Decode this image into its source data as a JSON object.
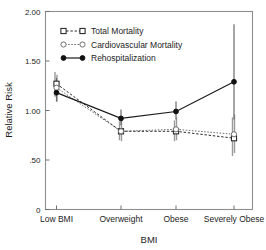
{
  "chart_data": {
    "type": "line",
    "title": "",
    "xlabel": "BMI",
    "ylabel": "Relative Risk",
    "categories": [
      "Low BMI",
      "Overweight",
      "Obese",
      "Severely Obese"
    ],
    "ylim": [
      0,
      2.0
    ],
    "yticks": [
      0,
      0.5,
      1.0,
      1.5,
      2.0
    ],
    "ytick_labels": [
      "0",
      ".50",
      "1.00",
      "1.50",
      "2.00"
    ],
    "grid": false,
    "legend_position": "upper left",
    "series": [
      {
        "name": "Total Mortality",
        "marker": "open-square",
        "line": "dashed",
        "values": [
          1.27,
          0.79,
          0.79,
          0.72
        ],
        "ci_low": [
          1.14,
          0.7,
          0.69,
          0.54
        ],
        "ci_high": [
          1.39,
          0.89,
          0.9,
          0.93
        ]
      },
      {
        "name": "Cardiovascular Mortality",
        "marker": "open-circle",
        "line": "dotted",
        "values": [
          1.23,
          0.79,
          0.81,
          0.76
        ],
        "ci_low": [
          1.09,
          0.69,
          0.7,
          0.57
        ],
        "ci_high": [
          1.36,
          0.9,
          0.93,
          0.96
        ]
      },
      {
        "name": "Rehospitalization",
        "marker": "filled-circle",
        "line": "solid",
        "values": [
          1.18,
          0.92,
          0.99,
          1.29
        ],
        "ci_low": [
          1.09,
          0.85,
          0.91,
          0.91
        ],
        "ci_high": [
          1.33,
          1.01,
          1.09,
          1.87
        ]
      }
    ]
  },
  "legend": {
    "items": [
      {
        "label": "Total Mortality"
      },
      {
        "label": "Cardiovascular Mortality"
      },
      {
        "label": "Rehospitalization"
      }
    ]
  }
}
